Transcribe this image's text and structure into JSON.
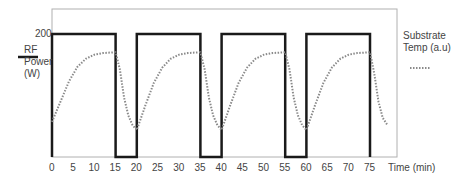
{
  "chart_data": {
    "type": "line",
    "title": "",
    "xlabel": "Time (min)",
    "ylabel": "RF Power (W)",
    "y2label": "Substrate Temp (a.u)",
    "xlim": [
      0,
      80
    ],
    "xticks": [
      0,
      5,
      10,
      15,
      20,
      25,
      30,
      35,
      40,
      45,
      50,
      55,
      60,
      65,
      70,
      75
    ],
    "yticks": [
      200
    ],
    "grid": false,
    "legend_position": "outside-left-and-right",
    "series": [
      {
        "name": "RF Power (W)",
        "style": "solid-black",
        "x": [
          0,
          0,
          15,
          15,
          20,
          20,
          35,
          35,
          40,
          40,
          55,
          55,
          60,
          60,
          75,
          75
        ],
        "values": [
          0,
          200,
          200,
          0,
          0,
          200,
          200,
          0,
          0,
          200,
          200,
          0,
          0,
          200,
          200,
          0
        ]
      },
      {
        "name": "Substrate Temp (a.u)",
        "style": "dotted-gray",
        "x": [
          0,
          2,
          4,
          6,
          8,
          10,
          12,
          15,
          16,
          17,
          18,
          19,
          20,
          22,
          24,
          26,
          28,
          30,
          32,
          35,
          36,
          37,
          38,
          39,
          40,
          42,
          44,
          46,
          48,
          50,
          52,
          55,
          56,
          57,
          58,
          59,
          60,
          62,
          64,
          66,
          68,
          70,
          72,
          75,
          76,
          77,
          78,
          79
        ],
        "values": [
          0.1,
          0.35,
          0.6,
          0.78,
          0.88,
          0.93,
          0.95,
          0.96,
          0.75,
          0.4,
          0.18,
          0.06,
          0.0,
          0.3,
          0.58,
          0.77,
          0.88,
          0.93,
          0.95,
          0.96,
          0.75,
          0.4,
          0.18,
          0.06,
          0.0,
          0.3,
          0.58,
          0.77,
          0.88,
          0.93,
          0.95,
          0.96,
          0.75,
          0.4,
          0.18,
          0.06,
          0.0,
          0.3,
          0.58,
          0.77,
          0.88,
          0.93,
          0.95,
          0.96,
          0.7,
          0.35,
          0.15,
          0.07
        ]
      }
    ]
  },
  "labels": {
    "y_tick_200": "200",
    "rf_line1": "RF",
    "rf_line2": "Power",
    "rf_line3": "(W)",
    "temp_line1": "Substrate",
    "temp_line2": "Temp (a.u)",
    "time_label": "Time (min)",
    "x_ticks": [
      "0",
      "5",
      "10",
      "15",
      "20",
      "25",
      "30",
      "35",
      "40",
      "45",
      "50",
      "55",
      "60",
      "65",
      "70",
      "75"
    ]
  },
  "colors": {
    "power": "#1a1a1a",
    "temp": "#8a8a8a",
    "frame": "#aaaaaa"
  }
}
